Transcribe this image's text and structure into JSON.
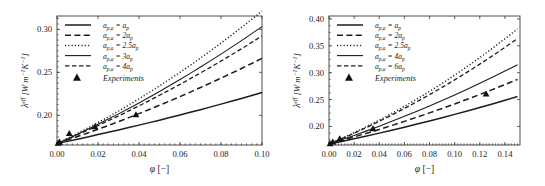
{
  "chart_data": [
    {
      "type": "line",
      "panel": "left",
      "title": "",
      "xlabel": "φ [−]",
      "ylabel": "λᵉᶠᶠ [W m⁻¹K⁻¹]",
      "ylabel_parts": {
        "symbol": "λ",
        "superscript": "eff",
        "units": "[W m",
        "unit_exp1": "-1",
        "unit_mid": "K",
        "unit_exp2": "-1",
        "unit_close": "]"
      },
      "xlim": [
        0.0,
        0.1
      ],
      "ylim": [
        0.1655,
        0.3155
      ],
      "xticks": [
        0.0,
        0.02,
        0.04,
        0.06,
        0.08,
        0.1
      ],
      "xtick_labels": [
        "0.00",
        "0.02",
        "0.04",
        "0.06",
        "0.08",
        "0.10"
      ],
      "yticks": [
        0.2,
        0.25,
        0.3
      ],
      "ytick_labels": [
        "0.20",
        "0.25",
        "0.30"
      ],
      "grid": false,
      "legend_position": "upper-left",
      "series": [
        {
          "name": "a_{p,a} = a_p",
          "style": "solid",
          "label_base": "a",
          "label_sub": "p,a",
          "label_eq": "=",
          "label_coef": "",
          "label_rhs_base": "a",
          "label_rhs_sub": "p",
          "x": [
            0.0,
            0.005,
            0.01,
            0.015,
            0.02,
            0.025,
            0.03,
            0.035,
            0.04,
            0.045,
            0.05,
            0.055,
            0.06,
            0.065,
            0.07,
            0.075,
            0.08,
            0.085,
            0.09,
            0.095,
            0.1
          ],
          "y": [
            0.1672,
            0.1697,
            0.1723,
            0.1749,
            0.1776,
            0.1803,
            0.183,
            0.1858,
            0.1886,
            0.1915,
            0.1944,
            0.1974,
            0.2004,
            0.2035,
            0.2066,
            0.2098,
            0.213,
            0.2163,
            0.2196,
            0.223,
            0.2265
          ]
        },
        {
          "name": "a_{p,a} = 2a_p",
          "style": "dashed",
          "label_base": "a",
          "label_sub": "p,a",
          "label_eq": "=",
          "label_coef": "2",
          "label_rhs_base": "a",
          "label_rhs_sub": "p",
          "x": [
            0.0,
            0.005,
            0.01,
            0.015,
            0.02,
            0.025,
            0.03,
            0.035,
            0.04,
            0.045,
            0.05,
            0.055,
            0.06,
            0.065,
            0.07,
            0.075,
            0.08,
            0.085,
            0.09,
            0.095,
            0.1
          ],
          "y": [
            0.1672,
            0.1712,
            0.1753,
            0.1795,
            0.1838,
            0.1882,
            0.1927,
            0.1973,
            0.202,
            0.2068,
            0.2117,
            0.2167,
            0.2218,
            0.227,
            0.2323,
            0.2377,
            0.2432,
            0.2488,
            0.2545,
            0.2603,
            0.2662
          ]
        },
        {
          "name": "a_{p,a} = 2.5a_p",
          "style": "dotted",
          "label_base": "a",
          "label_sub": "p,a",
          "label_eq": "=",
          "label_coef": "2.5",
          "label_rhs_base": "a",
          "label_rhs_sub": "p",
          "x": [
            0.0,
            0.005,
            0.01,
            0.015,
            0.02,
            0.025,
            0.03,
            0.035,
            0.04,
            0.045,
            0.05,
            0.055,
            0.06,
            0.065,
            0.07,
            0.075,
            0.08,
            0.085,
            0.09,
            0.095,
            0.1
          ],
          "y": [
            0.1672,
            0.173,
            0.179,
            0.1852,
            0.1916,
            0.1982,
            0.205,
            0.212,
            0.2192,
            0.2266,
            0.2342,
            0.242,
            0.25,
            0.2582,
            0.2666,
            0.2752,
            0.284,
            0.293,
            0.3022,
            0.3116,
            0.3212
          ]
        },
        {
          "name": "a_{p,a} = 3a_p",
          "style": "solid-thin",
          "label_base": "a",
          "label_sub": "p,a",
          "label_eq": "=",
          "label_coef": "3",
          "label_rhs_base": "a",
          "label_rhs_sub": "p",
          "x": [
            0.0,
            0.005,
            0.01,
            0.015,
            0.02,
            0.025,
            0.03,
            0.035,
            0.04,
            0.045,
            0.05,
            0.055,
            0.06,
            0.065,
            0.07,
            0.075,
            0.08,
            0.085,
            0.09,
            0.095,
            0.1
          ],
          "y": [
            0.1672,
            0.1726,
            0.1781,
            0.1838,
            0.1896,
            0.1956,
            0.2017,
            0.208,
            0.2144,
            0.221,
            0.2277,
            0.2346,
            0.2416,
            0.2488,
            0.2561,
            0.2636,
            0.2712,
            0.279,
            0.2869,
            0.295,
            0.3032
          ]
        },
        {
          "name": "a_{p,a} = 4a_p",
          "style": "dash-long",
          "label_base": "a",
          "label_sub": "p,a",
          "label_eq": "=",
          "label_coef": "4",
          "label_rhs_base": "a",
          "label_rhs_sub": "p",
          "x": [
            0.0,
            0.005,
            0.01,
            0.015,
            0.02,
            0.025,
            0.03,
            0.035,
            0.04,
            0.045,
            0.05,
            0.055,
            0.06,
            0.065,
            0.07,
            0.075,
            0.08,
            0.085,
            0.09,
            0.095,
            0.1
          ],
          "y": [
            0.1672,
            0.1722,
            0.1774,
            0.1827,
            0.1881,
            0.1937,
            0.1993,
            0.2051,
            0.211,
            0.2171,
            0.2233,
            0.2296,
            0.236,
            0.2426,
            0.2493,
            0.2561,
            0.2631,
            0.2702,
            0.2774,
            0.2848,
            0.2923
          ]
        }
      ],
      "experiments": {
        "label": "Experiments",
        "marker": "triangle",
        "points": [
          [
            0.0005,
            0.1678
          ],
          [
            0.0012,
            0.169
          ],
          [
            0.006,
            0.179
          ],
          [
            0.0185,
            0.1868
          ],
          [
            0.0385,
            0.2008
          ]
        ]
      }
    },
    {
      "type": "line",
      "panel": "right",
      "title": "",
      "xlabel": "φ [−]",
      "ylabel": "λᵉᶠᶠ [W m⁻¹K⁻¹]",
      "xlim": [
        0.0,
        0.152
      ],
      "ylim": [
        0.1655,
        0.4055
      ],
      "xticks": [
        0.0,
        0.02,
        0.04,
        0.06,
        0.08,
        0.1,
        0.12,
        0.14
      ],
      "xtick_labels": [
        "0.00",
        "0.02",
        "0.04",
        "0.06",
        "0.08",
        "0.10",
        "0.12",
        "0.14"
      ],
      "yticks": [
        0.2,
        0.25,
        0.3,
        0.35,
        0.4
      ],
      "ytick_labels": [
        "0.20",
        "0.25",
        "0.30",
        "0.35",
        "0.40"
      ],
      "grid": false,
      "legend_position": "upper-left",
      "series": [
        {
          "name": "a_{p,a} = a_p",
          "style": "solid",
          "label_base": "a",
          "label_sub": "p,a",
          "label_eq": "=",
          "label_coef": "",
          "label_rhs_base": "a",
          "label_rhs_sub": "p",
          "x": [
            0.0,
            0.01,
            0.02,
            0.03,
            0.04,
            0.05,
            0.06,
            0.07,
            0.08,
            0.09,
            0.1,
            0.11,
            0.12,
            0.13,
            0.14,
            0.15
          ],
          "y": [
            0.1672,
            0.1721,
            0.1771,
            0.1823,
            0.1876,
            0.1931,
            0.1987,
            0.2044,
            0.2103,
            0.2163,
            0.2225,
            0.2288,
            0.2353,
            0.2419,
            0.2487,
            0.2556
          ]
        },
        {
          "name": "a_{p,a} = 2a_p",
          "style": "dashed",
          "label_base": "a",
          "label_sub": "p,a",
          "label_eq": "=",
          "label_coef": "2",
          "label_rhs_base": "a",
          "label_rhs_sub": "p",
          "x": [
            0.0,
            0.01,
            0.02,
            0.03,
            0.04,
            0.05,
            0.06,
            0.07,
            0.08,
            0.09,
            0.1,
            0.11,
            0.12,
            0.13,
            0.14,
            0.15
          ],
          "y": [
            0.1672,
            0.1737,
            0.1805,
            0.1874,
            0.1945,
            0.2019,
            0.2094,
            0.2172,
            0.2252,
            0.2334,
            0.2418,
            0.2505,
            0.2594,
            0.2685,
            0.2779,
            0.2875
          ]
        },
        {
          "name": "a_{p,a} = 2.5a_p",
          "style": "dotted",
          "label_base": "a",
          "label_sub": "p,a",
          "label_eq": "=",
          "label_coef": "2.5",
          "label_rhs_base": "a",
          "label_rhs_sub": "p",
          "x": [
            0.0,
            0.01,
            0.02,
            0.03,
            0.04,
            0.05,
            0.06,
            0.07,
            0.08,
            0.09,
            0.1,
            0.11,
            0.12,
            0.13,
            0.14,
            0.15
          ],
          "y": [
            0.1672,
            0.1775,
            0.1884,
            0.1998,
            0.2118,
            0.2243,
            0.2374,
            0.2511,
            0.2653,
            0.2801,
            0.2955,
            0.3115,
            0.3281,
            0.3453,
            0.3631,
            0.3815
          ]
        },
        {
          "name": "a_{p,a} = 4a_p",
          "style": "solid-thin",
          "label_base": "a",
          "label_sub": "p,a",
          "label_eq": "=",
          "label_coef": "4",
          "label_rhs_base": "a",
          "label_rhs_sub": "p",
          "x": [
            0.0,
            0.01,
            0.02,
            0.03,
            0.04,
            0.05,
            0.06,
            0.07,
            0.08,
            0.09,
            0.1,
            0.11,
            0.12,
            0.13,
            0.14,
            0.15
          ],
          "y": [
            0.1672,
            0.1751,
            0.1833,
            0.1918,
            0.2005,
            0.2095,
            0.2188,
            0.2284,
            0.2382,
            0.2483,
            0.2587,
            0.2694,
            0.2803,
            0.2915,
            0.303,
            0.3148
          ]
        },
        {
          "name": "a_{p,a} = 6a_p",
          "style": "dash-long",
          "label_base": "a",
          "label_sub": "p,a",
          "label_eq": "=",
          "label_coef": "6",
          "label_rhs_base": "a",
          "label_rhs_sub": "p",
          "x": [
            0.0,
            0.01,
            0.02,
            0.03,
            0.04,
            0.05,
            0.06,
            0.07,
            0.08,
            0.09,
            0.1,
            0.11,
            0.12,
            0.13,
            0.14,
            0.15
          ],
          "y": [
            0.1672,
            0.1771,
            0.1875,
            0.1983,
            0.2096,
            0.2213,
            0.2335,
            0.2461,
            0.2592,
            0.2727,
            0.2867,
            0.3011,
            0.316,
            0.3313,
            0.3471,
            0.3633
          ]
        }
      ],
      "experiments": {
        "label": "Experiments",
        "marker": "triangle",
        "points": [
          [
            0.0008,
            0.1682
          ],
          [
            0.003,
            0.1712
          ],
          [
            0.0085,
            0.1775
          ],
          [
            0.035,
            0.1962
          ],
          [
            0.125,
            0.2608
          ]
        ]
      }
    }
  ]
}
